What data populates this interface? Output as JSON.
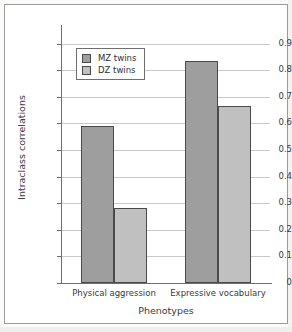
{
  "chart_data": {
    "type": "bar",
    "title": "",
    "xlabel": "Phenotypes",
    "ylabel": "Intraclass correlations",
    "categories": [
      "Physical aggression",
      "Expressive vocabulary"
    ],
    "series": [
      {
        "name": "MZ twins",
        "values": [
          0.59,
          0.835
        ],
        "color": "#9e9e9e"
      },
      {
        "name": "DZ twins",
        "values": [
          0.28,
          0.665
        ],
        "color": "#c0c0c0"
      }
    ],
    "ylim": [
      0,
      0.95
    ],
    "yticks": [
      0,
      0.1,
      0.2,
      0.3,
      0.4,
      0.5,
      0.6,
      0.7,
      0.8,
      0.9
    ],
    "ytick_labels": [
      "0",
      "0.1",
      "0.2",
      "0.3",
      "0.4",
      "0.5",
      "0.6",
      "0.7",
      "0.8",
      "0.9"
    ],
    "grid": "horizontal",
    "legend_position": "upper-left-inside",
    "legend_entries": [
      "MZ twins",
      "DZ twins"
    ]
  },
  "colors": {
    "mz_fill": "#9e9e9e",
    "dz_fill": "#c0c0c0",
    "bar_outline": "#4a4a4a",
    "gridline": "#c8c8c8",
    "axis": "#6e6e6e",
    "text": "#3a3a3a",
    "page_background": "#ffffff"
  }
}
